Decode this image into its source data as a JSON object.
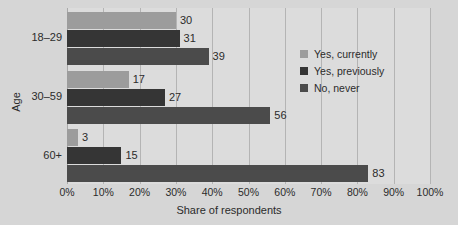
{
  "chart_data": {
    "type": "bar",
    "orientation": "horizontal",
    "title": "",
    "xlabel": "Share of respondents",
    "ylabel": "Age",
    "categories": [
      "18–29",
      "30–59",
      "60+"
    ],
    "series": [
      {
        "name": "Yes, currently",
        "values": [
          30,
          17,
          3
        ],
        "color": "#9c9c9c"
      },
      {
        "name": "Yes, previously",
        "values": [
          31,
          27,
          15
        ],
        "color": "#353535"
      },
      {
        "name": "No, never",
        "values": [
          39,
          56,
          83
        ],
        "color": "#4b4b4b"
      }
    ],
    "xlim": [
      0,
      100
    ],
    "xticks": [
      0,
      10,
      20,
      30,
      40,
      50,
      60,
      70,
      80,
      90,
      100
    ],
    "xtick_labels": [
      "0%",
      "10%",
      "20%",
      "30%",
      "40%",
      "50%",
      "60%",
      "70%",
      "80%",
      "90%",
      "100%"
    ],
    "grid": true,
    "grid_axis": "x",
    "legend_position": "center-right",
    "data_labels": true,
    "background_color": "#d6d6d6",
    "plot_background_color": "#dcdcdc",
    "gridline_color": "#b4b4b4",
    "text_color": "#2b2b2b"
  },
  "legend": {
    "items": [
      {
        "label": "Yes, currently"
      },
      {
        "label": "Yes, previously"
      },
      {
        "label": "No, never"
      }
    ]
  },
  "axes": {
    "x_title": "Share of respondents",
    "y_title": "Age"
  }
}
